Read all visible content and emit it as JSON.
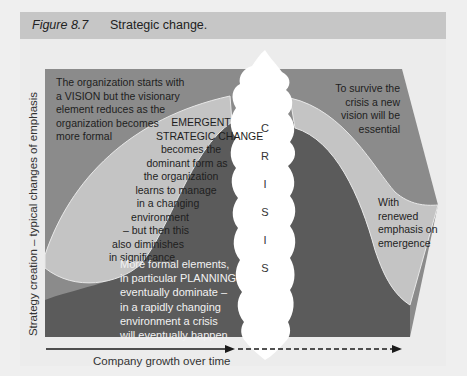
{
  "figure": {
    "number": "Figure 8.7",
    "title": "Strategic change."
  },
  "colors": {
    "background": "#efefef",
    "header": "#c6c6c6",
    "vision_area": "#8b8b8b",
    "emergent_area": "#c4c4c4",
    "planning_area": "#5b5b5b",
    "crisis_column": "#ffffff"
  },
  "axes": {
    "y_label": "Strategy creation – typical changes of emphasis",
    "x_label": "Company growth over time"
  },
  "annotations": {
    "vision": [
      "The organization starts with",
      "a VISION but the visionary",
      "element reduces as the",
      "organization becomes",
      "more formal"
    ],
    "emergent": [
      "EMERGENT",
      "STRATEGIC CHANGE",
      "becomes the",
      "dominant form as",
      "the organization",
      "learns to manage",
      "in a changing",
      "environment",
      "– but then this",
      "also diminishes",
      "in significance"
    ],
    "planning": [
      "More formal elements,",
      "in particular PLANNING",
      "eventually dominate –",
      "in a rapidly changing",
      "environment a crisis",
      "will eventually happen"
    ],
    "new_vision": [
      "To survive the",
      "crisis a new",
      "vision will be",
      "essential"
    ],
    "renewed": [
      "With",
      "renewed",
      "emphasis on",
      "emergence"
    ]
  },
  "crisis": {
    "letters": [
      "C",
      "R",
      "I",
      "S",
      "I",
      "S"
    ]
  }
}
